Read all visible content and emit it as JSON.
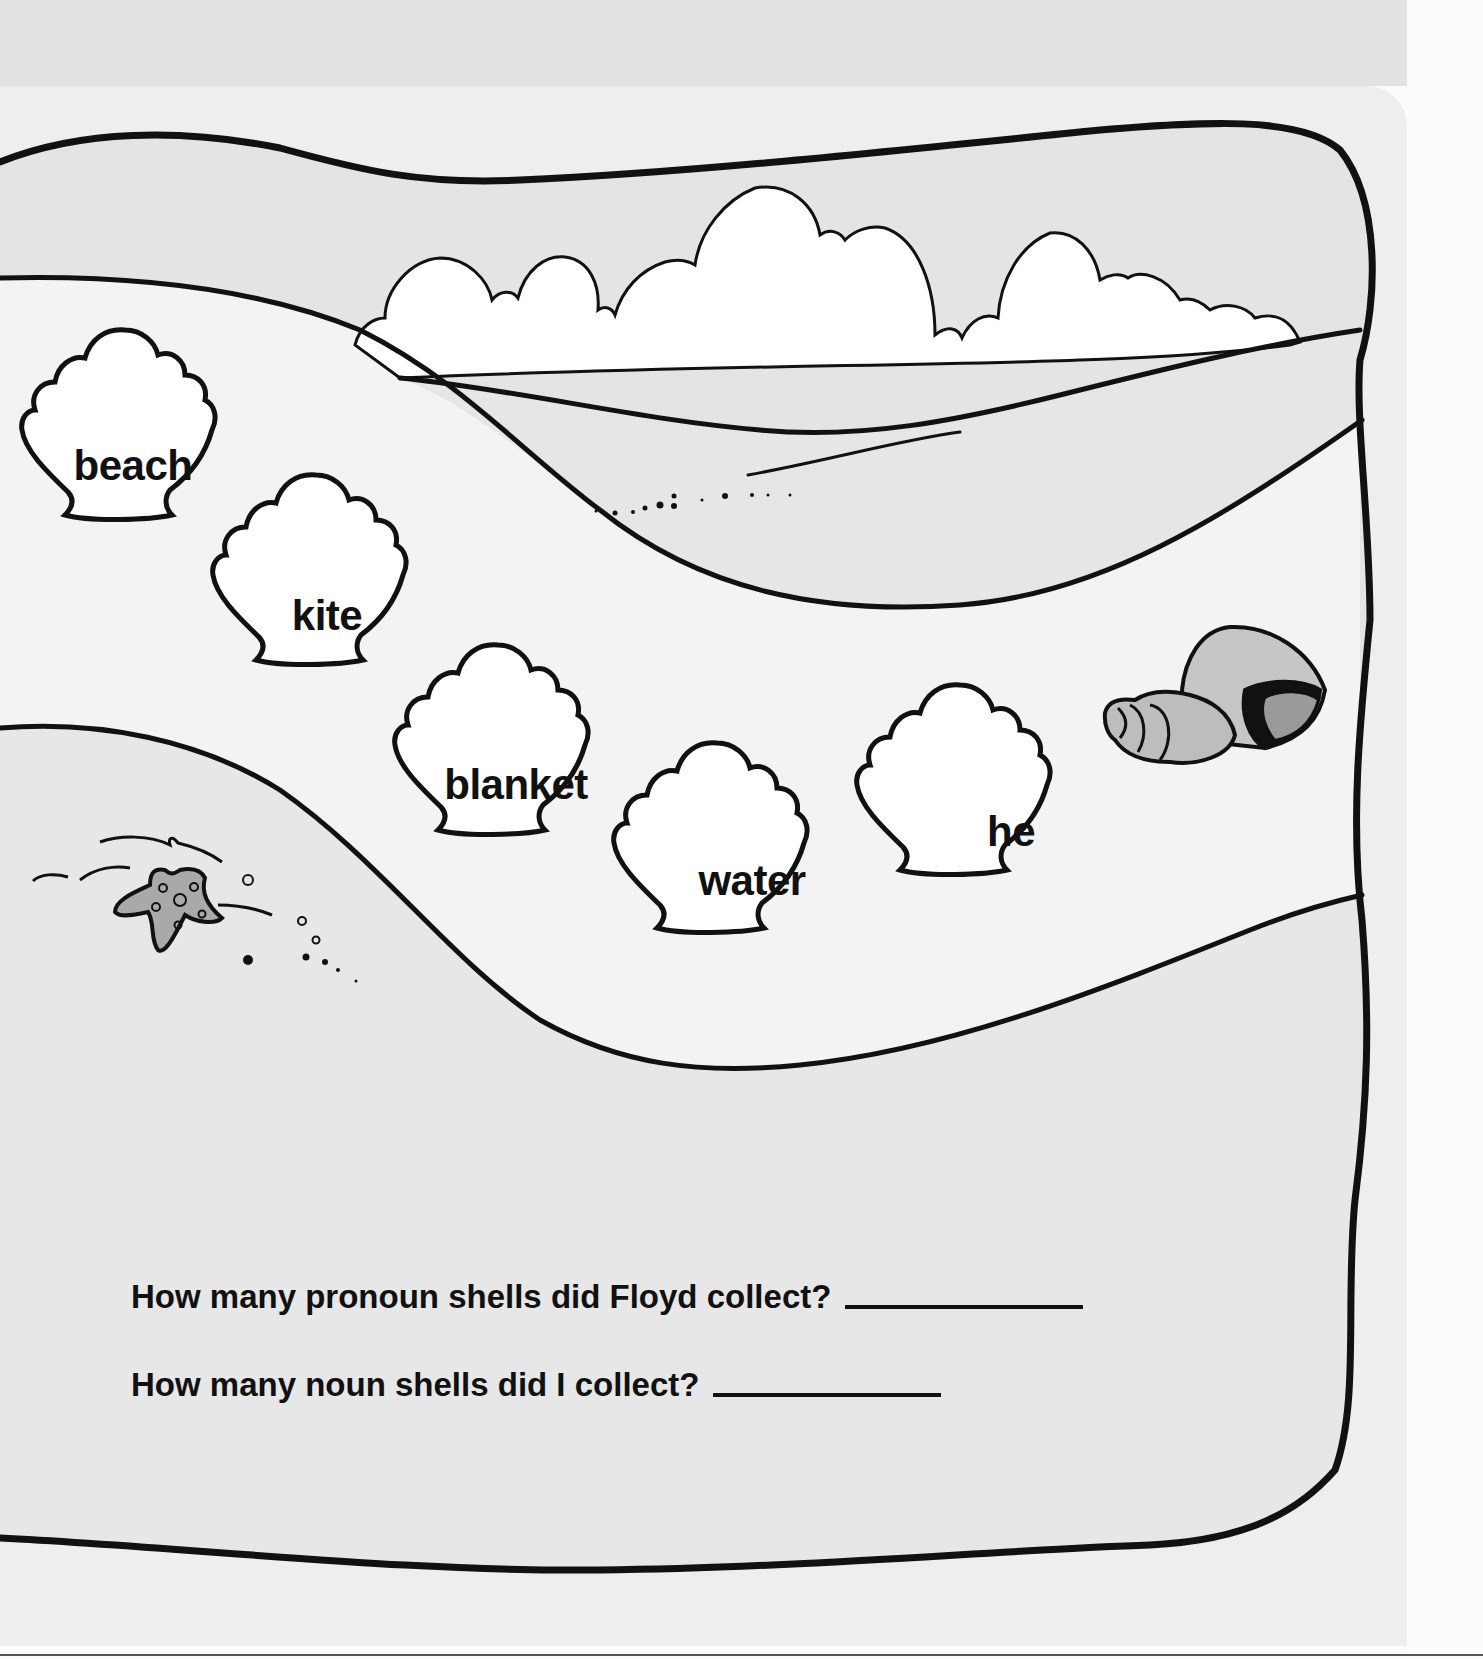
{
  "worksheet": {
    "shells": [
      {
        "word": "beach",
        "x": 127,
        "y": 466
      },
      {
        "word": "kite",
        "x": 326,
        "y": 616
      },
      {
        "word": "blanket",
        "x": 516,
        "y": 785
      },
      {
        "word": "water",
        "x": 752,
        "y": 881
      },
      {
        "word": "he",
        "x": 1010,
        "y": 832
      }
    ],
    "questions": [
      {
        "text": "How many pronoun shells did Floyd collect?",
        "answer": ""
      },
      {
        "text": "How many noun shells did I collect?",
        "answer": ""
      }
    ]
  },
  "colors": {
    "ink": "#111111",
    "sky": "#e4e4e4",
    "sand_light": "#f3f3f3",
    "sand_dark": "#e6e6e6",
    "shell_fill": "#ffffff",
    "critter_fill": "#a9a9a9"
  }
}
